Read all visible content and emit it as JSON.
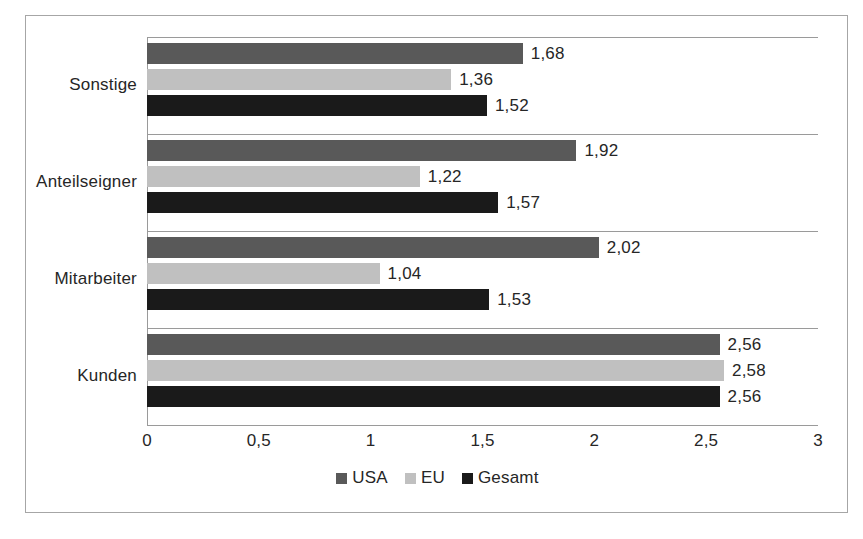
{
  "chart_data": {
    "type": "bar",
    "orientation": "horizontal",
    "title": "",
    "xlabel": "",
    "ylabel": "",
    "categories": [
      "Kunden",
      "Mitarbeiter",
      "Anteilseigner",
      "Sonstige"
    ],
    "categories_top_to_bottom": [
      "Sonstige",
      "Anteilseigner",
      "Mitarbeiter",
      "Kunden"
    ],
    "series": [
      {
        "name": "USA",
        "color": "#595959",
        "values": [
          2.56,
          2.02,
          1.92,
          1.68
        ]
      },
      {
        "name": "EU",
        "color": "#c0c0c0",
        "values": [
          2.58,
          1.04,
          1.22,
          1.36
        ]
      },
      {
        "name": "Gesamt",
        "color": "#1a1a1a",
        "values": [
          2.56,
          1.53,
          1.57,
          1.52
        ]
      }
    ],
    "data_labels": {
      "Sonstige": {
        "USA": "1,68",
        "EU": "1,36",
        "Gesamt": "1,52"
      },
      "Anteilseigner": {
        "USA": "1,92",
        "EU": "1,22",
        "Gesamt": "1,57"
      },
      "Mitarbeiter": {
        "USA": "2,02",
        "EU": "1,04",
        "Gesamt": "1,53"
      },
      "Kunden": {
        "USA": "2,56",
        "EU": "2,58",
        "Gesamt": "2,56"
      }
    },
    "xlim": [
      0,
      3
    ],
    "xticks": [
      0,
      0.5,
      1,
      1.5,
      2,
      2.5,
      3
    ],
    "xtick_labels": [
      "0",
      "0,5",
      "1",
      "1,5",
      "2",
      "2,5",
      "3"
    ],
    "grid": false,
    "group_separator_lines": true,
    "legend_position": "bottom",
    "decimal_separator": ","
  },
  "groups": [
    {
      "label": "Sonstige",
      "bars": [
        {
          "series": "USA",
          "value": 1.68,
          "label": "1,68",
          "color": "#595959"
        },
        {
          "series": "EU",
          "value": 1.36,
          "label": "1,36",
          "color": "#c0c0c0"
        },
        {
          "series": "Gesamt",
          "value": 1.52,
          "label": "1,52",
          "color": "#1a1a1a"
        }
      ]
    },
    {
      "label": "Anteilseigner",
      "bars": [
        {
          "series": "USA",
          "value": 1.92,
          "label": "1,92",
          "color": "#595959"
        },
        {
          "series": "EU",
          "value": 1.22,
          "label": "1,22",
          "color": "#c0c0c0"
        },
        {
          "series": "Gesamt",
          "value": 1.57,
          "label": "1,57",
          "color": "#1a1a1a"
        }
      ]
    },
    {
      "label": "Mitarbeiter",
      "bars": [
        {
          "series": "USA",
          "value": 2.02,
          "label": "2,02",
          "color": "#595959"
        },
        {
          "series": "EU",
          "value": 1.04,
          "label": "1,04",
          "color": "#c0c0c0"
        },
        {
          "series": "Gesamt",
          "value": 1.53,
          "label": "1,53",
          "color": "#1a1a1a"
        }
      ]
    },
    {
      "label": "Kunden",
      "bars": [
        {
          "series": "USA",
          "value": 2.56,
          "label": "2,56",
          "color": "#595959"
        },
        {
          "series": "EU",
          "value": 2.58,
          "label": "2,58",
          "color": "#c0c0c0"
        },
        {
          "series": "Gesamt",
          "value": 2.56,
          "label": "2,56",
          "color": "#1a1a1a"
        }
      ]
    }
  ],
  "legend": [
    {
      "label": "USA",
      "color": "#595959"
    },
    {
      "label": "EU",
      "color": "#c0c0c0"
    },
    {
      "label": "Gesamt",
      "color": "#1a1a1a"
    }
  ],
  "axis": {
    "tick_labels": [
      "0",
      "0,5",
      "1",
      "1,5",
      "2",
      "2,5",
      "3"
    ],
    "tick_values": [
      0,
      0.5,
      1,
      1.5,
      2,
      2.5,
      3
    ],
    "min": 0,
    "max": 3
  },
  "style": {
    "frame_border": "#a6a6a6",
    "separator_line": "#9a9a9a",
    "text": "#262626",
    "background": "#ffffff"
  }
}
